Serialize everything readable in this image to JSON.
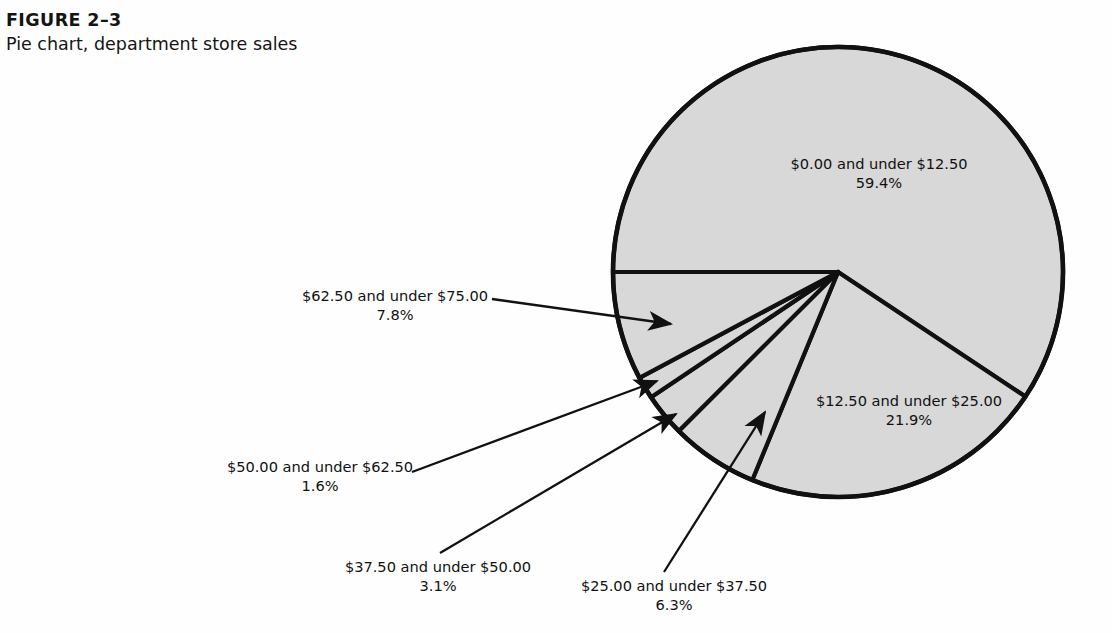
{
  "figure": {
    "number": "FIGURE 2–3",
    "title": "Pie chart, department store sales"
  },
  "colors": {
    "page_background": "#fefefe",
    "slice_fill": "#d8d8d8",
    "outline": "#111111",
    "text": "#111111"
  },
  "chart_data": {
    "type": "pie",
    "title": "Pie chart, department store sales",
    "subtitle": "FIGURE 2–3",
    "xlabel": "",
    "ylabel": "",
    "legend_position": "none",
    "grid": false,
    "labels_mode": "callout",
    "units": "percent",
    "categories": [
      "$0.00 and under $12.50",
      "$12.50 and under $25.00",
      "$25.00 and under $37.50",
      "$37.50 and under $50.00",
      "$50.00 and under $62.50",
      "$62.50 and under $75.00"
    ],
    "values": [
      59.4,
      21.9,
      6.3,
      3.1,
      1.6,
      7.8
    ],
    "value_labels": [
      "59.4%",
      "21.9%",
      "6.3%",
      "3.1%",
      "1.6%",
      "7.8%"
    ],
    "total": 100.1,
    "start_angle_deg": 180,
    "direction": "clockwise",
    "slices": [
      {
        "range": "$0.00 and under $12.50",
        "percent_label": "59.4%",
        "value": 59.4,
        "label_placement": "inside"
      },
      {
        "range": "$12.50 and under $25.00",
        "percent_label": "21.9%",
        "value": 21.9,
        "label_placement": "inside"
      },
      {
        "range": "$25.00 and under $37.50",
        "percent_label": "6.3%",
        "value": 6.3,
        "label_placement": "callout"
      },
      {
        "range": "$37.50 and under $50.00",
        "percent_label": "3.1%",
        "value": 3.1,
        "label_placement": "callout"
      },
      {
        "range": "$50.00 and under $62.50",
        "percent_label": "1.6%",
        "value": 1.6,
        "label_placement": "callout"
      },
      {
        "range": "$62.50 and under $75.00",
        "percent_label": "7.8%",
        "value": 7.8,
        "label_placement": "callout"
      }
    ]
  }
}
